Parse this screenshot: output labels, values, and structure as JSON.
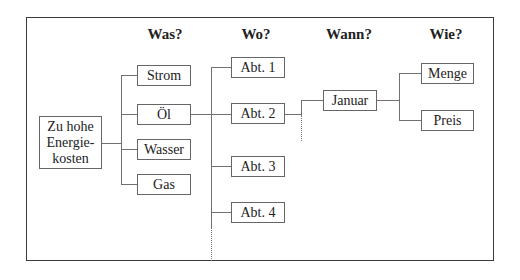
{
  "diagram": {
    "type": "tree",
    "headers": [
      "Was?",
      "Wo?",
      "Wann?",
      "Wie?"
    ],
    "root": {
      "lines": [
        "Zu hohe",
        "Energie-",
        "kosten"
      ]
    },
    "was": [
      "Strom",
      "Öl",
      "Wasser",
      "Gas"
    ],
    "wo": [
      "Abt. 1",
      "Abt. 2",
      "Abt. 3",
      "Abt. 4"
    ],
    "wann": [
      "Januar"
    ],
    "wie": [
      "Menge",
      "Preis"
    ],
    "edges": [
      {
        "from": "Zu hohe Energiekosten",
        "to": [
          "Strom",
          "Öl",
          "Wasser",
          "Gas"
        ]
      },
      {
        "from": "Öl",
        "to": [
          "Abt. 1",
          "Abt. 2",
          "Abt. 3",
          "Abt. 4"
        ],
        "continues": "dotted"
      },
      {
        "from": "Abt. 2",
        "to": [
          "Januar"
        ],
        "continues": "dotted"
      },
      {
        "from": "Januar",
        "to": [
          "Menge",
          "Preis"
        ]
      }
    ],
    "colors": {
      "frame": "#3a3a3a",
      "box_border": "#666666",
      "line": "#707070",
      "text": "#222222"
    }
  }
}
